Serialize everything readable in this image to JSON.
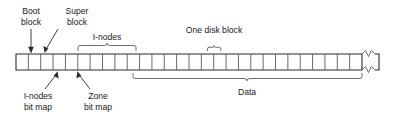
{
  "diagram": {
    "type": "disk-block-layout",
    "colors": {
      "background": "#ffffff",
      "text": "#1a1a1a",
      "bar_outline": "#2b2b2b",
      "cell_line": "#5a5a5a",
      "brace": "#4a4a4a",
      "arrow": "#2b2b2b"
    },
    "bar": {
      "x": 16,
      "y": 54,
      "width": 346,
      "height": 16,
      "cell_count": 28,
      "break_symbol": "zigzag-continuation"
    },
    "labels": {
      "boot_block": {
        "line1": "Boot",
        "line2": "block"
      },
      "super_block": {
        "line1": "Super",
        "line2": "block"
      },
      "inodes": "I-nodes",
      "one_disk_block": "One disk block",
      "inodes_bit_map": {
        "line1": "I-nodes",
        "line2": "bit map"
      },
      "zone_bit_map": {
        "line1": "Zone",
        "line2": "bit map"
      },
      "data": "Data"
    },
    "braces": [
      {
        "name": "inodes",
        "label": "I-nodes",
        "side": "top",
        "x1": 78,
        "x2": 136
      },
      {
        "name": "one-disk-block",
        "label": "One disk block",
        "side": "top",
        "x1": 207,
        "x2": 221
      },
      {
        "name": "data",
        "label": "Data",
        "side": "bottom",
        "x1": 133,
        "x2": 362
      }
    ],
    "pointers": [
      {
        "name": "boot-block",
        "label": "Boot block",
        "target_x": 31,
        "target_y": 54
      },
      {
        "name": "super-block",
        "label": "Super block",
        "target_x": 45,
        "target_y": 54
      },
      {
        "name": "inodes-bit-map",
        "label": "I-nodes bit map",
        "target_x": 57,
        "target_y": 70
      },
      {
        "name": "zone-bit-map",
        "label": "Zone bit map",
        "target_x": 78,
        "target_y": 70
      }
    ]
  }
}
